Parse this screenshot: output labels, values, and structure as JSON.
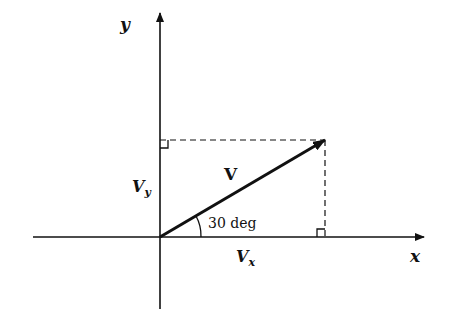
{
  "diagram": {
    "type": "vector-components",
    "axes": {
      "x_label": "x",
      "y_label": "y"
    },
    "vector": {
      "label": "V",
      "angle_label": "30 deg",
      "angle_deg": 30
    },
    "components": {
      "x_label": "V",
      "x_sub": "x",
      "y_label": "V",
      "y_sub": "y"
    }
  }
}
